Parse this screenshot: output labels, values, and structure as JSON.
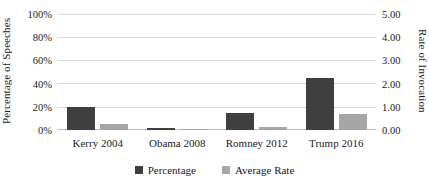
{
  "chart_data": {
    "type": "bar",
    "title": "",
    "subtitle": "",
    "xlabel": "",
    "categories": [
      "Kerry 2004",
      "Obama 2008",
      "Romney 2012",
      "Trump 2016"
    ],
    "series": [
      {
        "name": "Percentage",
        "axis": "left",
        "color": "#3f3f3f",
        "values": [
          0.2,
          0.02,
          0.15,
          0.45
        ],
        "value_labels": [
          "20%",
          "2%",
          "15%",
          "45%"
        ]
      },
      {
        "name": "Average Rate",
        "axis": "right",
        "color": "#a6a6a6",
        "values": [
          0.25,
          0.03,
          0.15,
          0.7
        ],
        "value_labels": [
          "0.25",
          "0.03",
          "0.15",
          "0.70"
        ]
      }
    ],
    "axes": {
      "left": {
        "label": "Percentage of Speeches",
        "ylim": [
          0,
          1.0
        ],
        "ticks": [
          1.0,
          0.8,
          0.6,
          0.4,
          0.2,
          0.0
        ],
        "tick_labels": [
          "100%",
          "80%",
          "60%",
          "40%",
          "20%",
          "0%"
        ]
      },
      "right": {
        "label": "Rate of Invocation",
        "ylim": [
          0,
          5.0
        ],
        "ticks": [
          5.0,
          4.0,
          3.0,
          2.0,
          1.0,
          0.0
        ],
        "tick_labels": [
          "5.00",
          "4.00",
          "3.00",
          "2.00",
          "1.00",
          "0.00"
        ]
      }
    },
    "grid": true,
    "legend": {
      "position": "bottom",
      "entries": [
        {
          "label": "Percentage",
          "color": "#3f3f3f"
        },
        {
          "label": "Average Rate",
          "color": "#a6a6a6"
        }
      ]
    }
  }
}
